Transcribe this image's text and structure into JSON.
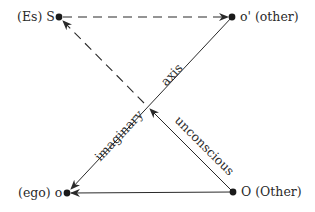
{
  "diagram": {
    "type": "schema-l",
    "nodes": [
      {
        "id": "S",
        "label": "(Es) S",
        "x": 59,
        "y": 17
      },
      {
        "id": "o_prime",
        "label": "o' (other)",
        "x": 232,
        "y": 17
      },
      {
        "id": "o",
        "label": "(ego) o",
        "x": 67,
        "y": 193
      },
      {
        "id": "O",
        "label": "O (Other)",
        "x": 233,
        "y": 192
      }
    ],
    "edges": [
      {
        "from": "S",
        "to": "o_prime",
        "style": "dashed",
        "arrow": "end"
      },
      {
        "from": "o_prime",
        "to": "o",
        "style": "solid",
        "arrow": "end",
        "label": "imaginary axis"
      },
      {
        "from": "O",
        "to": "o",
        "style": "solid",
        "arrow": "end"
      },
      {
        "from": "O",
        "to": "S",
        "style": "solid-then-dashed",
        "arrow": "end",
        "label": "unconscious"
      }
    ],
    "axis_labels": {
      "imaginary": "imaginary",
      "axis": "axis",
      "unconscious": "unconscious"
    },
    "colors": {
      "line": "#2a2a2a",
      "background": "#ffffff"
    }
  }
}
